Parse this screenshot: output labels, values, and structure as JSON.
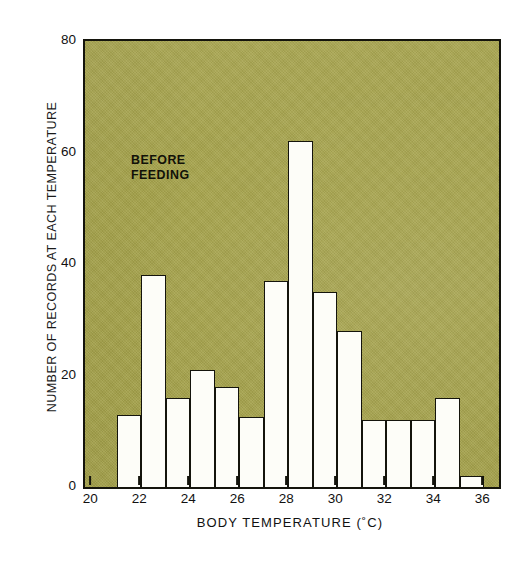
{
  "chart_data": {
    "type": "bar",
    "title": "",
    "annotation": "BEFORE FEEDING",
    "annotation_lines": [
      "BEFORE",
      "FEEDING"
    ],
    "xlabel": "BODY  TEMPERATURE  (˚C)",
    "ylabel": "NUMBER OF RECORDS AT EACH TEMPERATURE",
    "xlim": [
      19.7,
      36.6
    ],
    "ylim": [
      0,
      80
    ],
    "grid": false,
    "legend": false,
    "xticks": [
      20,
      22,
      24,
      26,
      28,
      30,
      32,
      34,
      36
    ],
    "xtick_labels": [
      "20",
      "22",
      "24",
      "26",
      "28",
      "30",
      "32",
      "34",
      "36"
    ],
    "yticks": [
      0,
      20,
      40,
      60,
      80
    ],
    "ytick_labels": [
      "0",
      "20",
      "40",
      "60",
      "80"
    ],
    "bin_width": 1,
    "categories": [
      "21-22",
      "22-23",
      "23-24",
      "24-25",
      "25-26",
      "26-27",
      "27-28",
      "28-29",
      "29-30",
      "30-31",
      "31-32",
      "32-33",
      "33-34",
      "34-35",
      "35-36"
    ],
    "bin_starts": [
      21,
      22,
      23,
      24,
      25,
      26,
      27,
      28,
      29,
      30,
      31,
      32,
      33,
      34,
      35
    ],
    "values": [
      13,
      38,
      16,
      21,
      18,
      12.5,
      37,
      62,
      35,
      28,
      12,
      12,
      12,
      16,
      2
    ],
    "bar_face_color": "#fdfdf8",
    "bar_edge_color": "#14140c",
    "plot_background_color": "#a6a34b",
    "figure_background_color": "#ffffff"
  },
  "axes": {
    "y_title": "NUMBER OF RECORDS AT EACH TEMPERATURE",
    "x_title": "BODY  TEMPERATURE  (˚C)"
  }
}
